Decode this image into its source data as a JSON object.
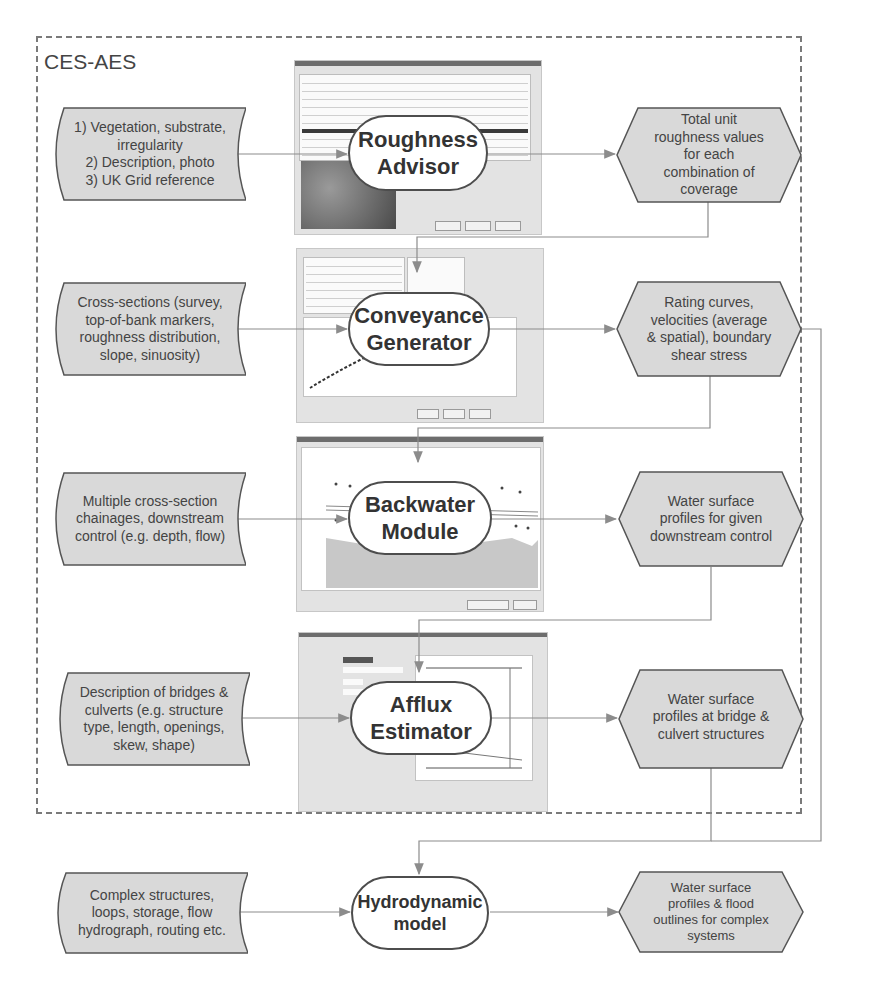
{
  "frame": {
    "title": "CES-AES"
  },
  "rows": [
    {
      "input": "1) Vegetation, substrate,\nirregularity\n2) Description, photo\n3) UK Grid reference",
      "process": "Roughness\nAdvisor",
      "output": "Total unit\nroughness values\nfor each\ncombination of\ncoverage",
      "screenshot": "roughness-advisor-window"
    },
    {
      "input": "Cross-sections (survey,\ntop-of-bank markers,\nroughness distribution,\nslope, sinuosity)",
      "process": "Conveyance\nGenerator",
      "output": "Rating curves,\nvelocities (average\n& spatial), boundary\nshear stress",
      "screenshot": "conveyance-generator-window"
    },
    {
      "input": "Multiple cross-section\nchainages, downstream\ncontrol (e.g. depth, flow)",
      "process": "Backwater\nModule",
      "output": "Water surface\nprofiles for given\ndownstream control",
      "screenshot": "backwater-module-window"
    },
    {
      "input": "Description of bridges &\nculverts (e.g. structure\ntype, length, openings,\nskew, shape)",
      "process": "Afflux\nEstimator",
      "output": "Water surface\nprofiles at bridge &\nculvert structures",
      "screenshot": "afflux-estimator-window"
    },
    {
      "input": "Complex structures,\nloops, storage, flow\nhydrograph, routing etc.",
      "process": "Hydrodynamic\nmodel",
      "output": "Water surface\nprofiles & flood\noutlines for complex\nsystems"
    }
  ],
  "colors": {
    "shape_fill": "#d9d9d9",
    "shape_stroke": "#555555",
    "connector": "#8c8c8c",
    "frame_border": "#7a7a7a",
    "process_fill": "#ffffff"
  }
}
